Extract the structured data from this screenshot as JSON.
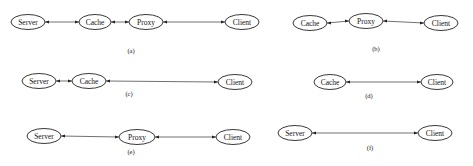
{
  "panels": [
    {
      "id": "a",
      "caption": "(a)",
      "caption_pos": [
        131,
        53
      ],
      "nodes": [
        {
          "label": "Server",
          "cx": 28,
          "cy": 22,
          "rx": 17,
          "ry": 7.5
        },
        {
          "label": "Cache",
          "cx": 95,
          "cy": 22,
          "rx": 16,
          "ry": 7.5
        },
        {
          "label": "Proxy",
          "cx": 146,
          "cy": 22,
          "rx": 17,
          "ry": 7.5
        },
        {
          "label": "Client",
          "cx": 242,
          "cy": 22,
          "rx": 17,
          "ry": 7.5
        }
      ],
      "edges": [
        [
          0,
          1
        ],
        [
          1,
          2
        ],
        [
          2,
          3
        ]
      ]
    },
    {
      "id": "b",
      "caption": "(b)",
      "caption_pos": [
        376,
        51
      ],
      "nodes": [
        {
          "label": "Cache",
          "cx": 310,
          "cy": 23,
          "rx": 17,
          "ry": 7.5
        },
        {
          "label": "Proxy",
          "cx": 366,
          "cy": 21,
          "rx": 17,
          "ry": 7.5
        },
        {
          "label": "Client",
          "cx": 441,
          "cy": 23,
          "rx": 17,
          "ry": 7.5
        }
      ],
      "edges": [
        [
          0,
          1
        ],
        [
          1,
          2
        ]
      ]
    },
    {
      "id": "c",
      "caption": "(c)",
      "caption_pos": [
        129,
        96
      ],
      "nodes": [
        {
          "label": "Server",
          "cx": 39,
          "cy": 81,
          "rx": 17,
          "ry": 7.5
        },
        {
          "label": "Cache",
          "cx": 89,
          "cy": 81,
          "rx": 17,
          "ry": 7.5
        },
        {
          "label": "Client",
          "cx": 235,
          "cy": 82,
          "rx": 17,
          "ry": 7.5
        }
      ],
      "edges": [
        [
          0,
          1
        ],
        [
          1,
          2
        ]
      ]
    },
    {
      "id": "d",
      "caption": "(d)",
      "caption_pos": [
        369,
        98
      ],
      "nodes": [
        {
          "label": "Cache",
          "cx": 330,
          "cy": 82,
          "rx": 16,
          "ry": 7.5
        },
        {
          "label": "Client",
          "cx": 437,
          "cy": 82,
          "rx": 16,
          "ry": 7.5
        }
      ],
      "edges": [
        [
          0,
          1
        ]
      ]
    },
    {
      "id": "e",
      "caption": "(e)",
      "caption_pos": [
        131,
        154
      ],
      "nodes": [
        {
          "label": "Server",
          "cx": 44,
          "cy": 136,
          "rx": 17,
          "ry": 7.5
        },
        {
          "label": "Proxy",
          "cx": 137,
          "cy": 137,
          "rx": 18,
          "ry": 7.5
        },
        {
          "label": "Client",
          "cx": 233,
          "cy": 137,
          "rx": 17,
          "ry": 7.5
        }
      ],
      "edges": [
        [
          0,
          1
        ],
        [
          1,
          2
        ]
      ]
    },
    {
      "id": "f",
      "caption": "(f)",
      "caption_pos": [
        370,
        150
      ],
      "nodes": [
        {
          "label": "Server",
          "cx": 295,
          "cy": 133,
          "rx": 17,
          "ry": 7.5
        },
        {
          "label": "Client",
          "cx": 435,
          "cy": 133,
          "rx": 17,
          "ry": 7.5
        }
      ],
      "edges": [
        [
          0,
          1
        ]
      ]
    }
  ],
  "colors": {
    "node_stroke": "#222222",
    "edge_stroke": "#333333",
    "text": "#111111",
    "background": "#ffffff"
  }
}
